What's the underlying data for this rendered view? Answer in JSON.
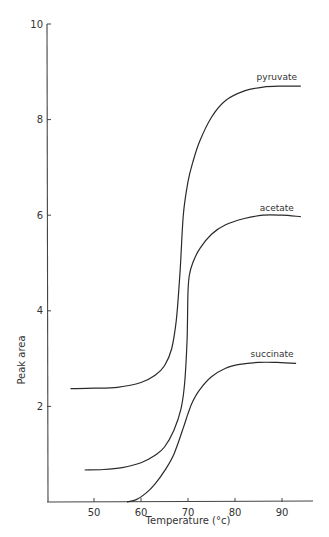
{
  "chart_data": {
    "type": "line",
    "title": "",
    "xlabel": "Temperature (°c)",
    "ylabel": "Peak area",
    "xlim": [
      40,
      97
    ],
    "ylim": [
      0,
      10
    ],
    "xticks": [
      50,
      60,
      70,
      80,
      90
    ],
    "yticks": [
      2,
      4,
      6,
      8,
      10
    ],
    "grid": false,
    "legend": "inline labels at curve ends",
    "series": [
      {
        "name": "pyruvate",
        "x": [
          45,
          50,
          55,
          60,
          63,
          65,
          66.5,
          67.5,
          68.3,
          69,
          70,
          71,
          72.5,
          75,
          78,
          82,
          86,
          90,
          94
        ],
        "y": [
          2.37,
          2.38,
          2.4,
          2.5,
          2.65,
          2.85,
          3.2,
          3.8,
          4.8,
          6.0,
          6.7,
          7.1,
          7.55,
          8.05,
          8.4,
          8.6,
          8.68,
          8.7,
          8.7
        ]
      },
      {
        "name": "acetate",
        "x": [
          48,
          52,
          56,
          60,
          63,
          65,
          67,
          68.5,
          69.3,
          69.8,
          70,
          70.3,
          71,
          72.5,
          75,
          78,
          82,
          86,
          90,
          94
        ],
        "y": [
          0.67,
          0.68,
          0.72,
          0.82,
          0.98,
          1.15,
          1.5,
          1.95,
          2.5,
          3.4,
          4.4,
          4.75,
          5.0,
          5.3,
          5.6,
          5.8,
          5.93,
          6.0,
          6.0,
          5.97
        ]
      },
      {
        "name": "succinate",
        "x": [
          57,
          59,
          61,
          63,
          65,
          67,
          69,
          70,
          71,
          72.5,
          75,
          78,
          81,
          85,
          89,
          93
        ],
        "y": [
          0,
          0.05,
          0.18,
          0.38,
          0.65,
          1.0,
          1.55,
          1.85,
          2.1,
          2.35,
          2.62,
          2.8,
          2.88,
          2.92,
          2.92,
          2.9
        ]
      }
    ]
  }
}
